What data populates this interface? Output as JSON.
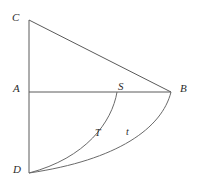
{
  "figure": {
    "background_color": "#ffffff",
    "line_color": "#5a5a5a",
    "curve_color": "#6a6a6a",
    "text_color": "#2b2b2b",
    "width": 197,
    "height": 189
  },
  "labels": {
    "C": "C",
    "A": "A",
    "B": "B",
    "D": "D",
    "S": "S",
    "T": "T",
    "t": "t"
  },
  "points": {
    "C": {
      "x": 29,
      "y": 20
    },
    "A": {
      "x": 29,
      "y": 92
    },
    "B": {
      "x": 171,
      "y": 92
    },
    "D": {
      "x": 29,
      "y": 173
    },
    "S": {
      "x": 117,
      "y": 92
    }
  },
  "segments": [
    {
      "name": "segment-CD",
      "from": "C",
      "to": "D"
    },
    {
      "name": "segment-CB",
      "from": "C",
      "to": "B"
    },
    {
      "name": "segment-AB",
      "from": "A",
      "to": "B"
    }
  ],
  "curves": [
    {
      "name": "arc-B-to-D",
      "label": "t",
      "from": "B",
      "to": "D"
    },
    {
      "name": "curve-S-to-D",
      "label": "T",
      "from": "S",
      "to": "D"
    }
  ]
}
